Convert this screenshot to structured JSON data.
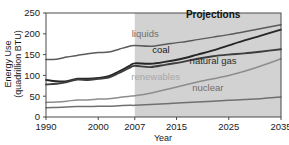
{
  "chart_data": {
    "type": "line",
    "title": "",
    "xlabel": "Year",
    "ylabel": "Energy Use (quadrillion BTU)",
    "ylabel_line1": "Energy Use",
    "ylabel_line2": "(quadrillion BTU)",
    "xlim": [
      1990,
      2035
    ],
    "ylim": [
      0,
      250
    ],
    "x_ticks": [
      "1990",
      "2000",
      "2007",
      "2015",
      "2025",
      "2035"
    ],
    "x_tick_values": [
      1990,
      2000,
      2007,
      2015,
      2025,
      2035
    ],
    "y_ticks": [
      "0",
      "50",
      "100",
      "150",
      "200",
      "250"
    ],
    "y_tick_values": [
      0,
      50,
      100,
      150,
      200,
      250
    ],
    "grid": false,
    "legend_position": "inline-annotations",
    "annotations": [
      {
        "text": "Projections",
        "x": 2022,
        "y": 237
      },
      {
        "text": "liquids",
        "x": 2009,
        "y": 192
      },
      {
        "text": "coal",
        "x": 2012,
        "y": 153
      },
      {
        "text": "natural gas",
        "x": 2022,
        "y": 127
      },
      {
        "text": "renewables",
        "x": 2011,
        "y": 90
      },
      {
        "text": "nuclear",
        "x": 2021,
        "y": 62
      }
    ],
    "projection_start": 2007,
    "projection_band_color": "#d2d2d2",
    "series": [
      {
        "name": "liquids",
        "color": "#5a5a5a",
        "label_color": "#6e6e6e",
        "x": [
          1990,
          1992,
          1994,
          1996,
          1998,
          2000,
          2002,
          2004,
          2006,
          2007,
          2010,
          2013,
          2016,
          2019,
          2022,
          2025,
          2028,
          2031,
          2035
        ],
        "values": [
          138,
          139,
          144,
          148,
          152,
          155,
          156,
          163,
          170,
          172,
          170,
          175,
          180,
          186,
          192,
          198,
          205,
          212,
          222
        ]
      },
      {
        "name": "coal",
        "color": "#262626",
        "label_color": "#1a1a1a",
        "x": [
          1990,
          1992,
          1994,
          1996,
          1998,
          2000,
          2002,
          2004,
          2006,
          2007,
          2010,
          2013,
          2016,
          2019,
          2022,
          2025,
          2028,
          2031,
          2035
        ],
        "values": [
          89,
          86,
          86,
          92,
          92,
          94,
          98,
          110,
          123,
          129,
          128,
          133,
          140,
          150,
          160,
          172,
          184,
          195,
          210
        ]
      },
      {
        "name": "natural gas",
        "color": "#3d3d3d",
        "label_color": "#2b2b2b",
        "x": [
          1990,
          1992,
          1994,
          1996,
          1998,
          2000,
          2002,
          2004,
          2006,
          2007,
          2010,
          2013,
          2016,
          2019,
          2022,
          2025,
          2028,
          2031,
          2035
        ],
        "values": [
          78,
          80,
          84,
          90,
          89,
          92,
          95,
          106,
          118,
          123,
          120,
          126,
          132,
          140,
          146,
          150,
          153,
          157,
          163
        ]
      },
      {
        "name": "renewables",
        "color": "#8d8d8d",
        "label_color": "#a8a8a8",
        "x": [
          1990,
          1992,
          1994,
          1996,
          1998,
          2000,
          2002,
          2004,
          2006,
          2007,
          2010,
          2013,
          2016,
          2019,
          2022,
          2025,
          2028,
          2031,
          2035
        ],
        "values": [
          35,
          36,
          38,
          41,
          41,
          43,
          44,
          47,
          50,
          51,
          57,
          66,
          75,
          84,
          92,
          100,
          110,
          122,
          140
        ]
      },
      {
        "name": "nuclear",
        "color": "#707070",
        "label_color": "#6e6e6e",
        "x": [
          1990,
          1992,
          1994,
          1996,
          1998,
          2000,
          2002,
          2004,
          2006,
          2007,
          2010,
          2013,
          2016,
          2019,
          2022,
          2025,
          2028,
          2031,
          2035
        ],
        "values": [
          22,
          23,
          24,
          25,
          25,
          26,
          26,
          27,
          28,
          28,
          30,
          32,
          34,
          36,
          38,
          40,
          42,
          44,
          48
        ]
      }
    ]
  }
}
